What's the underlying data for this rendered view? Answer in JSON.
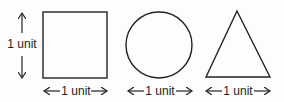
{
  "diagram": {
    "shapes": [
      {
        "type": "square",
        "width_label": "1 unit",
        "height_label": "1 unit"
      },
      {
        "type": "circle",
        "width_label": "1 unit"
      },
      {
        "type": "triangle",
        "width_label": "1 unit"
      }
    ],
    "labels": {
      "square_height": "1 unit",
      "square_width": "1 unit",
      "circle_width": "1 unit",
      "triangle_width": "1 unit"
    },
    "colors": {
      "stroke": "#222222",
      "background": "#fdfdfd"
    }
  }
}
